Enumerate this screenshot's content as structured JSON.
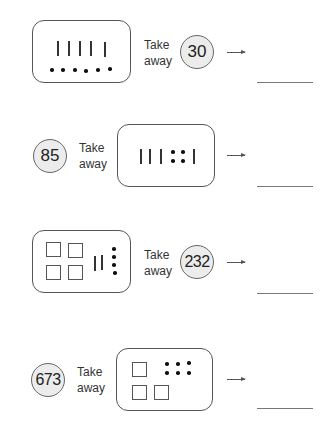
{
  "problems": [
    {
      "order": "blocks-first",
      "blocks": {
        "hundreds": 0,
        "tens": 5,
        "ones": 6
      },
      "take_away_label": [
        "Take",
        "away"
      ],
      "number": "30",
      "arrow": "right-arrow",
      "answer": ""
    },
    {
      "order": "number-first",
      "number": "85",
      "take_away_label": [
        "Take",
        "away"
      ],
      "blocks": {
        "hundreds": 0,
        "tens": 4,
        "ones": 4
      },
      "arrow": "right-arrow",
      "answer": ""
    },
    {
      "order": "blocks-first",
      "blocks": {
        "hundreds": 4,
        "tens": 2,
        "ones": 4
      },
      "take_away_label": [
        "Take",
        "away"
      ],
      "number": "232",
      "arrow": "right-arrow",
      "answer": ""
    },
    {
      "order": "number-first",
      "number": "673",
      "take_away_label": [
        "Take",
        "away"
      ],
      "blocks": {
        "hundreds": 3,
        "tens": 0,
        "ones": 6
      },
      "arrow": "right-arrow",
      "answer": ""
    }
  ],
  "colors": {
    "circle_fill": "#ececec",
    "stroke": "#555555"
  }
}
